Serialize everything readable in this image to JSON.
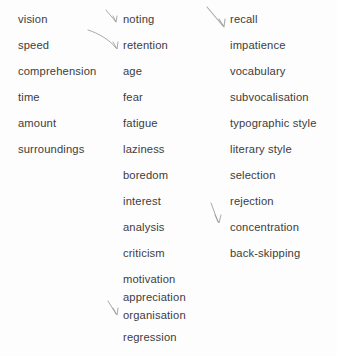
{
  "page": {
    "background_color": "#fdfdfd",
    "text_color": "#3c3c3c",
    "mark_color": "#9a9a9a",
    "width": 337,
    "height": 356
  },
  "columns": [
    {
      "name": "column-1",
      "x": 18,
      "items": [
        {
          "label": "vision",
          "y": 13
        },
        {
          "label": "speed",
          "y": 39
        },
        {
          "label": "comprehension",
          "y": 65
        },
        {
          "label": "time",
          "y": 91
        },
        {
          "label": "amount",
          "y": 117
        },
        {
          "label": "surroundings",
          "y": 143
        }
      ]
    },
    {
      "name": "column-2",
      "x": 123,
      "items": [
        {
          "label": "noting",
          "y": 13
        },
        {
          "label": "retention",
          "y": 39
        },
        {
          "label": "age",
          "y": 65
        },
        {
          "label": "fear",
          "y": 91
        },
        {
          "label": "fatigue",
          "y": 117
        },
        {
          "label": "laziness",
          "y": 143
        },
        {
          "label": "boredom",
          "y": 169
        },
        {
          "label": "interest",
          "y": 195
        },
        {
          "label": "analysis",
          "y": 221
        },
        {
          "label": "criticism",
          "y": 247
        },
        {
          "label": "motivation",
          "y": 273
        },
        {
          "label": "appreciation",
          "y": 291
        },
        {
          "label": "organisation",
          "y": 309
        },
        {
          "label": "regression",
          "y": 331
        }
      ]
    },
    {
      "name": "column-3",
      "x": 230,
      "items": [
        {
          "label": "recall",
          "y": 13
        },
        {
          "label": "impatience",
          "y": 39
        },
        {
          "label": "vocabulary",
          "y": 65
        },
        {
          "label": "subvocalisation",
          "y": 91
        },
        {
          "label": "typographic style",
          "y": 117
        },
        {
          "label": "literary style",
          "y": 143
        },
        {
          "label": "selection",
          "y": 169
        },
        {
          "label": "rejection",
          "y": 195
        },
        {
          "label": "concentration",
          "y": 221
        },
        {
          "label": "back-skipping",
          "y": 247
        }
      ]
    }
  ],
  "annotation_marks": [
    {
      "name": "arrow-mark-noting",
      "target": "noting",
      "path": "M 106 10 L 116 22",
      "head": "M 113 16 L 116 22 L 117 16",
      "stroke_width": 1.0
    },
    {
      "name": "arrow-mark-retention",
      "target": "retention",
      "path": "M 88 30 C 98 33 110 40 116 48",
      "head": "M 113 42 L 117 49 L 118 42",
      "stroke_width": 1.0
    },
    {
      "name": "arrow-mark-recall",
      "target": "recall",
      "path": "M 207 7 L 223 26",
      "head": "M 219 19 L 224 27 L 225 19",
      "stroke_width": 1.1
    },
    {
      "name": "arrow-mark-concentration",
      "target": "concentration",
      "path": "M 211 203 L 218 222",
      "head": "M 215 215 L 219 223 L 221 215",
      "stroke_width": 1.0
    },
    {
      "name": "arrow-mark-organisation",
      "target": "organisation",
      "path": "M 108 301 L 116 314",
      "head": "M 113 308 L 117 315 L 118 308",
      "stroke_width": 1.0
    }
  ]
}
